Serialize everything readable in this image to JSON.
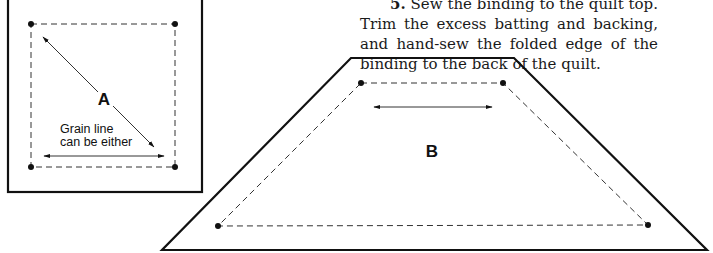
{
  "instructions": {
    "step_number": "5.",
    "text": "Sew the binding to the quilt top. Trim the excess batting and backing, and hand-sew the folded edge of the binding to the back of the quilt."
  },
  "template_a": {
    "label": "A",
    "grain_note_line1": "Grain line",
    "grain_note_line2": "can be either"
  },
  "template_b": {
    "label": "B"
  },
  "colors": {
    "line": "#111111",
    "background": "#ffffff"
  }
}
